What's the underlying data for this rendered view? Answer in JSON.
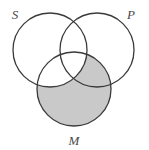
{
  "figure": {
    "type": "venn-diagram",
    "background_color": "#ffffff",
    "stroke_color": "#3a3a3a",
    "stroke_width": 1.3,
    "shade_color": "#c9c9c9",
    "width": 149,
    "height": 150
  },
  "labels": {
    "s": "S",
    "p": "P",
    "m": "M"
  },
  "circles": {
    "s": {
      "name": "S",
      "cx": 50,
      "cy": 50,
      "r": 37
    },
    "p": {
      "name": "P",
      "cx": 97,
      "cy": 50,
      "r": 37
    },
    "m": {
      "name": "M",
      "cx": 74,
      "cy": 89,
      "r": 37
    }
  },
  "label_positions": {
    "s": {
      "x": 15,
      "y": 19
    },
    "p": {
      "x": 131,
      "y": 19
    },
    "m": {
      "x": 74,
      "y": 145
    }
  },
  "shading": {
    "description": "M minus S",
    "shaded_regions": [
      "M-only",
      "M-and-P-not-S"
    ],
    "unshaded_regions": [
      "S-only",
      "P-only",
      "S-and-P-not-M",
      "S-and-M-not-P",
      "S-and-P-and-M"
    ],
    "color": "#c9c9c9"
  }
}
